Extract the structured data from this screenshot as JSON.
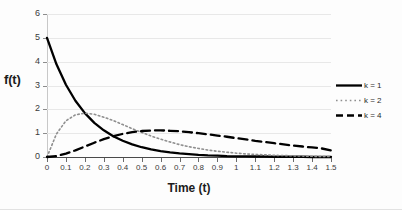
{
  "chart_data": {
    "type": "line",
    "title": "",
    "xlabel": "Time (t)",
    "ylabel": "f(t)",
    "xlim": [
      0,
      1.5
    ],
    "ylim": [
      0,
      6
    ],
    "grid": true,
    "legend_position": "right",
    "x_ticks": [
      "0",
      "0.1",
      "0.2",
      "0.3",
      "0.4",
      "0.5",
      "0.6",
      "0.7",
      "0.8",
      "0.9",
      "1",
      "1.1",
      "1.2",
      "1.3",
      "1.4",
      "1.5"
    ],
    "y_ticks": [
      "0",
      "1",
      "2",
      "3",
      "4",
      "5",
      "6"
    ],
    "x": [
      0,
      0.05,
      0.1,
      0.15,
      0.2,
      0.25,
      0.3,
      0.35,
      0.4,
      0.45,
      0.5,
      0.55,
      0.6,
      0.65,
      0.7,
      0.75,
      0.8,
      0.85,
      0.9,
      0.95,
      1.0,
      1.05,
      1.1,
      1.15,
      1.2,
      1.25,
      1.3,
      1.35,
      1.4,
      1.45,
      1.5
    ],
    "series": [
      {
        "name": "k = 1",
        "style": "solid",
        "color": "#000000",
        "values": [
          5.0,
          3.89,
          3.03,
          2.36,
          1.84,
          1.43,
          1.12,
          0.87,
          0.68,
          0.53,
          0.41,
          0.32,
          0.25,
          0.19,
          0.15,
          0.12,
          0.09,
          0.07,
          0.06,
          0.04,
          0.03,
          0.03,
          0.02,
          0.02,
          0.01,
          0.01,
          0.01,
          0.01,
          0.0,
          0.0,
          0.0
        ]
      },
      {
        "name": "k = 2",
        "style": "dotted",
        "color": "#8f8f8f",
        "values": [
          0.0,
          0.97,
          1.52,
          1.77,
          1.84,
          1.79,
          1.67,
          1.53,
          1.36,
          1.19,
          1.03,
          0.88,
          0.75,
          0.63,
          0.52,
          0.43,
          0.36,
          0.29,
          0.24,
          0.2,
          0.16,
          0.13,
          0.11,
          0.09,
          0.07,
          0.06,
          0.05,
          0.04,
          0.03,
          0.02,
          0.02
        ]
      },
      {
        "name": "k = 4",
        "style": "dashed",
        "color": "#000000",
        "values": [
          0.0,
          0.04,
          0.14,
          0.28,
          0.44,
          0.6,
          0.75,
          0.87,
          0.97,
          1.04,
          1.09,
          1.11,
          1.12,
          1.1,
          1.08,
          1.04,
          1.0,
          0.95,
          0.9,
          0.85,
          0.79,
          0.74,
          0.68,
          0.63,
          0.58,
          0.53,
          0.48,
          0.44,
          0.4,
          0.36,
          0.28
        ]
      }
    ]
  }
}
